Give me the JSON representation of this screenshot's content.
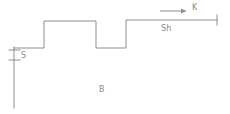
{
  "figure": {
    "background_color": "#ffffff",
    "line_color": "#8d8d8d",
    "label_color": "#8a8a8a",
    "stroke_width": 1,
    "width": 230,
    "height": 114
  },
  "labels": {
    "s": "S",
    "b": "B",
    "sh": "Sh",
    "k": "K"
  },
  "icons": {
    "arrow": "right-arrow-icon",
    "axis": "vertical-axis-icon",
    "end_tick": "end-tick-icon"
  },
  "chart_data": {
    "type": "line",
    "xlabel": "",
    "ylabel": "",
    "xlim": [
      0,
      230
    ],
    "ylim": [
      114,
      0
    ],
    "grid": false,
    "legend": "none",
    "series": [
      {
        "name": "step-waveform",
        "comment": "staircase trace: low shelf, high plateau, dip, final high plateau",
        "points": [
          [
            14,
            48
          ],
          [
            44,
            48
          ],
          [
            44,
            21
          ],
          [
            96,
            21
          ],
          [
            96,
            48
          ],
          [
            126,
            48
          ],
          [
            126,
            20
          ],
          [
            217,
            20
          ]
        ]
      },
      {
        "name": "vertical-axis",
        "comment": "vertical reference line descending from left shelf",
        "points": [
          [
            14,
            47
          ],
          [
            14,
            108
          ]
        ]
      },
      {
        "name": "axis-tick-upper",
        "points": [
          [
            9,
            50
          ],
          [
            20,
            50
          ]
        ]
      },
      {
        "name": "axis-tick-lower",
        "points": [
          [
            9,
            60
          ],
          [
            20,
            60
          ]
        ]
      },
      {
        "name": "end-tick",
        "comment": "short vertical tick closing the right plateau",
        "points": [
          [
            217,
            15
          ],
          [
            217,
            25
          ]
        ]
      },
      {
        "name": "direction-arrow",
        "comment": "arrow indicating direction K",
        "points": [
          [
            160,
            11
          ],
          [
            186,
            11
          ]
        ],
        "arrowhead_at": [
          186,
          11
        ],
        "direction": "right"
      }
    ],
    "annotations": [
      {
        "text": "S",
        "x": 21,
        "y": 58
      },
      {
        "text": "B",
        "x": 99,
        "y": 92
      },
      {
        "text": "Sh",
        "x": 161,
        "y": 31
      },
      {
        "text": "K",
        "x": 192,
        "y": 10
      }
    ]
  }
}
